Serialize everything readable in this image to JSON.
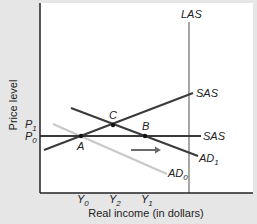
{
  "diagram": {
    "axes": {
      "y_label": "Price level",
      "x_label": "Real income (in dollars)"
    },
    "price_levels": {
      "p1": {
        "base": "P",
        "sub": "1"
      },
      "p0": {
        "base": "P",
        "sub": "0"
      }
    },
    "income_levels": {
      "y0": {
        "base": "Y",
        "sub": "0"
      },
      "y2": {
        "base": "Y",
        "sub": "2"
      },
      "y1": {
        "base": "Y",
        "sub": "1"
      }
    },
    "curves": {
      "las": "LAS",
      "sas_sloped": "SAS",
      "sas_flat": "SAS",
      "ad1": {
        "base": "AD",
        "sub": "1"
      },
      "ad0": {
        "base": "AD",
        "sub": "0"
      }
    },
    "points": {
      "a": "A",
      "b": "B",
      "c": "C"
    },
    "colors": {
      "background": "#e6e6e6",
      "plot": "#ffffff",
      "dark_line": "#3a3a3a",
      "las_line": "#8a8a8a",
      "ad0_line": "#c8c8c8",
      "arrow": "#6a6a6a"
    }
  }
}
